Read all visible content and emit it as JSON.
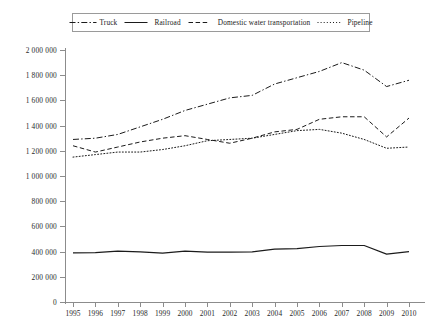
{
  "legend": {
    "position": "top",
    "items": [
      {
        "label": "Truck",
        "dash": "dashdot",
        "icon": "dash-dot-line-icon"
      },
      {
        "label": "Railroad",
        "dash": "solid",
        "icon": "solid-line-icon"
      },
      {
        "label": "Domestic water transportation",
        "dash": "dashed",
        "icon": "dashed-line-icon"
      },
      {
        "label": "Pipeline",
        "dash": "dotted",
        "icon": "dotted-line-icon"
      }
    ]
  },
  "axes": {
    "y_ticks": [
      "0",
      "200 000",
      "400 000",
      "600 000",
      "800 000",
      "1 000 000",
      "1 200 000",
      "1 400 000",
      "1 600 000",
      "1 800 000",
      "2 000 000"
    ],
    "x_ticks": [
      "1995",
      "1996",
      "1997",
      "1998",
      "1999",
      "2000",
      "2001",
      "2002",
      "2003",
      "2004",
      "2005",
      "2006",
      "2007",
      "2008",
      "2009",
      "2010"
    ]
  },
  "chart_data": {
    "type": "line",
    "title": "",
    "subtitle": "",
    "xlabel": "",
    "ylabel": "",
    "xlim": [
      1995,
      2010
    ],
    "ylim": [
      0,
      2000000
    ],
    "ytick_step": 200000,
    "grid": false,
    "legend_position": "top",
    "x": [
      1995,
      1996,
      1997,
      1998,
      1999,
      2000,
      2001,
      2002,
      2003,
      2004,
      2005,
      2006,
      2007,
      2008,
      2009,
      2010
    ],
    "categories": [
      "1995",
      "1996",
      "1997",
      "1998",
      "1999",
      "2000",
      "2001",
      "2002",
      "2003",
      "2004",
      "2005",
      "2006",
      "2007",
      "2008",
      "2009",
      "2010"
    ],
    "series": [
      {
        "name": "Truck",
        "style": "dashdot",
        "color": "#1b1b1b",
        "values": [
          1290000,
          1300000,
          1330000,
          1390000,
          1450000,
          1520000,
          1570000,
          1620000,
          1640000,
          1730000,
          1780000,
          1830000,
          1900000,
          1840000,
          1710000,
          1760000
        ]
      },
      {
        "name": "Railroad",
        "style": "solid",
        "color": "#1b1b1b",
        "values": [
          390000,
          392000,
          404000,
          398000,
          388000,
          404000,
          396000,
          396000,
          398000,
          420000,
          424000,
          440000,
          448000,
          448000,
          380000,
          400000
        ]
      },
      {
        "name": "Domestic water transportation",
        "style": "dashed",
        "color": "#1b1b1b",
        "values": [
          1240000,
          1190000,
          1230000,
          1270000,
          1300000,
          1320000,
          1290000,
          1260000,
          1300000,
          1350000,
          1370000,
          1450000,
          1470000,
          1470000,
          1310000,
          1460000
        ]
      },
      {
        "name": "Pipeline",
        "style": "dotted",
        "color": "#1b1b1b",
        "values": [
          1150000,
          1170000,
          1190000,
          1190000,
          1210000,
          1240000,
          1280000,
          1290000,
          1300000,
          1330000,
          1360000,
          1370000,
          1340000,
          1290000,
          1220000,
          1230000
        ]
      }
    ]
  }
}
